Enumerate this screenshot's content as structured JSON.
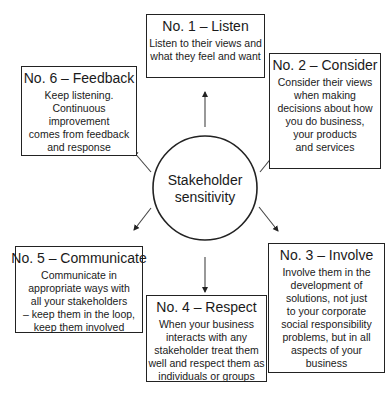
{
  "diagram": {
    "center": {
      "label": "Stakeholder\nsensitivity"
    },
    "steps": [
      {
        "number": 1,
        "title": "No. 1 – Listen",
        "text": "Listen to their views and\nwhat they feel and want"
      },
      {
        "number": 2,
        "title": "No. 2 – Consider",
        "text": "Consider their views\nwhen making\ndecisions about how\nyou do business,\nyour products\nand services"
      },
      {
        "number": 3,
        "title": "No. 3 – Involve",
        "text": "Involve them in the\ndevelopment of\nsolutions, not just\nto your corporate\nsocial responsibility\nproblems, but in all\naspects of your\nbusiness"
      },
      {
        "number": 4,
        "title": "No. 4 – Respect",
        "text": "When your business\ninteracts with any\nstakeholder treat them\nwell and respect them as\nindividuals or groups"
      },
      {
        "number": 5,
        "title": "No. 5 – Communicate",
        "text": "Communicate in\nappropriate ways with\nall your stakeholders\n– keep them in the loop,\nkeep them involved"
      },
      {
        "number": 6,
        "title": "No. 6 – Feedback",
        "text": "Keep listening.\nContinuous improvement\ncomes from feedback\nand response"
      }
    ],
    "colors": {
      "line": "#222222",
      "background": "#ffffff",
      "text": "#1a1a1a"
    }
  }
}
